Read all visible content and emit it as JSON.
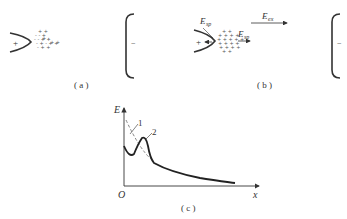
{
  "panels": {
    "a": {
      "label": "( a )",
      "anode_sign": "+",
      "cathode_sign": "−"
    },
    "b": {
      "label": "( b )",
      "anode_sign": "+",
      "cathode_sign": "−",
      "field_labels": {
        "space_charge_field_1": "E",
        "space_charge_field_1_sub": "sp",
        "space_charge_field_2": "E",
        "space_charge_field_2_sub": "sp",
        "external_field": "E",
        "external_field_sub": "ex"
      }
    },
    "c": {
      "label": "( c )",
      "y_axis_label": "E",
      "x_axis_label": "x",
      "origin_label": "O",
      "curve_labels": [
        "1",
        "2"
      ]
    }
  },
  "colors": {
    "stroke": "#333333",
    "dashed": "#777777",
    "charges": "#555555"
  }
}
